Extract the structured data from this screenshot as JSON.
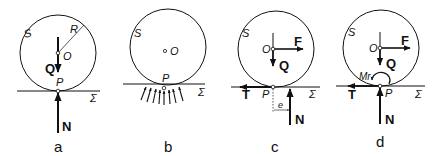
{
  "figure": {
    "panels": [
      {
        "id": "a",
        "caption": "a",
        "body_label": "S",
        "center_label": "O",
        "radius_label": "R",
        "weight_label": "Q",
        "contact_label": "P",
        "plane_label": "Σ",
        "normal_label": "N"
      },
      {
        "id": "b",
        "caption": "b",
        "body_label": "S",
        "center_label": "O",
        "contact_label": "P",
        "plane_label": "Σ",
        "pressure_arrows": 8
      },
      {
        "id": "c",
        "caption": "c",
        "body_label": "S",
        "center_label": "O",
        "force_label": "F",
        "weight_label": "Q",
        "contact_label": "P",
        "plane_label": "Σ",
        "friction_label": "T",
        "offset_label": "e",
        "normal_label": "N"
      },
      {
        "id": "d",
        "caption": "d",
        "body_label": "S",
        "center_label": "O",
        "force_label": "F",
        "weight_label": "Q",
        "contact_label": "P",
        "plane_label": "Σ",
        "friction_label": "T",
        "moment_label": "Mr",
        "normal_label": "N"
      }
    ],
    "colors": {
      "ink": "#111111",
      "background": "#ffffff"
    }
  }
}
